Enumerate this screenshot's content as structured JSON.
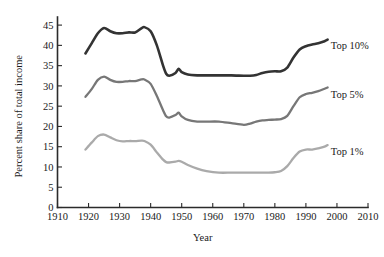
{
  "chart_data": {
    "type": "line",
    "title": "",
    "xlabel": "Year",
    "ylabel": "Percent share of total income",
    "xlim": [
      1910,
      2010
    ],
    "ylim": [
      0,
      47
    ],
    "grid": false,
    "legend_position": "inline-right",
    "xticks": [
      1910,
      1920,
      1930,
      1940,
      1950,
      1960,
      1970,
      1980,
      1990,
      2000,
      2010
    ],
    "xticklabels": [
      "1910",
      "1920",
      "1930",
      "1940",
      "1950",
      "1960",
      "1970",
      "1980",
      "1990",
      "2000",
      "2010"
    ],
    "yticks": [
      0,
      5,
      10,
      15,
      20,
      25,
      30,
      35,
      40,
      45
    ],
    "yticklabels": [
      "0",
      "5",
      "10",
      "15",
      "20",
      "25",
      "30",
      "35",
      "40",
      "45"
    ],
    "series": [
      {
        "name": "Top 10%",
        "color": "#333333",
        "label_x": 1998,
        "label_y": 39.2,
        "x": [
          1919,
          1921,
          1923,
          1925,
          1927,
          1929,
          1931,
          1933,
          1935,
          1937,
          1938,
          1940,
          1942,
          1944,
          1945,
          1946,
          1948,
          1949,
          1950,
          1952,
          1955,
          1958,
          1962,
          1966,
          1970,
          1972,
          1974,
          1976,
          1978,
          1980,
          1982,
          1984,
          1986,
          1988,
          1990,
          1992,
          1994,
          1996,
          1997
        ],
        "y": [
          38.0,
          40.5,
          43.0,
          44.3,
          43.5,
          43.0,
          43.0,
          43.2,
          43.2,
          44.2,
          44.5,
          43.5,
          40.0,
          35.0,
          33.0,
          32.5,
          33.2,
          34.2,
          33.4,
          32.8,
          32.6,
          32.6,
          32.6,
          32.6,
          32.5,
          32.5,
          32.7,
          33.2,
          33.5,
          33.6,
          33.6,
          34.5,
          37.0,
          39.0,
          39.8,
          40.2,
          40.5,
          41.0,
          41.4
        ]
      },
      {
        "name": "Top 5%",
        "color": "#777777",
        "label_x": 1998,
        "label_y": 27.0,
        "x": [
          1919,
          1921,
          1923,
          1925,
          1927,
          1929,
          1931,
          1933,
          1935,
          1937,
          1938,
          1940,
          1942,
          1944,
          1945,
          1946,
          1948,
          1949,
          1950,
          1952,
          1955,
          1958,
          1962,
          1966,
          1970,
          1972,
          1974,
          1976,
          1978,
          1980,
          1982,
          1984,
          1986,
          1988,
          1990,
          1992,
          1994,
          1996,
          1997
        ],
        "y": [
          27.3,
          29.2,
          31.5,
          32.3,
          31.5,
          31.0,
          31.0,
          31.2,
          31.2,
          31.6,
          31.6,
          30.5,
          27.5,
          24.0,
          22.5,
          22.2,
          22.8,
          23.4,
          22.5,
          21.6,
          21.2,
          21.2,
          21.2,
          20.8,
          20.4,
          20.7,
          21.2,
          21.5,
          21.6,
          21.7,
          21.8,
          22.6,
          25.0,
          27.2,
          28.0,
          28.3,
          28.7,
          29.3,
          29.6
        ]
      },
      {
        "name": "Top 1%",
        "color": "#aaaaaa",
        "label_x": 1998,
        "label_y": 13.0,
        "x": [
          1919,
          1921,
          1923,
          1925,
          1927,
          1929,
          1931,
          1933,
          1935,
          1937,
          1938,
          1940,
          1942,
          1944,
          1945,
          1946,
          1948,
          1949,
          1950,
          1952,
          1955,
          1958,
          1962,
          1966,
          1970,
          1972,
          1974,
          1976,
          1978,
          1980,
          1982,
          1984,
          1986,
          1988,
          1990,
          1992,
          1994,
          1996,
          1997
        ],
        "y": [
          14.3,
          16.0,
          17.6,
          18.0,
          17.3,
          16.6,
          16.3,
          16.4,
          16.4,
          16.5,
          16.4,
          15.5,
          13.6,
          11.8,
          11.2,
          11.1,
          11.3,
          11.5,
          11.3,
          10.5,
          9.6,
          9.0,
          8.6,
          8.6,
          8.6,
          8.6,
          8.6,
          8.6,
          8.6,
          8.7,
          9.0,
          10.2,
          12.2,
          13.8,
          14.3,
          14.3,
          14.6,
          15.0,
          15.4
        ]
      }
    ]
  }
}
